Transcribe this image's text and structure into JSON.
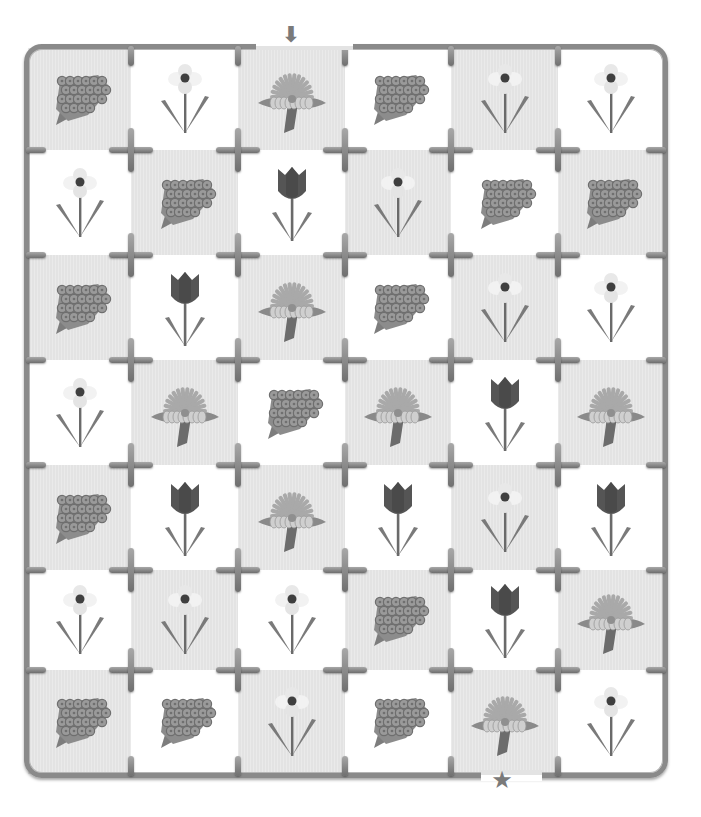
{
  "puzzle": {
    "type": "flower-maze",
    "columns": 6,
    "rows": 7,
    "entrance": {
      "marker": "down-arrow",
      "glyph": "⬇",
      "column": 2,
      "side": "top"
    },
    "exit": {
      "marker": "star",
      "glyph": "★",
      "column": 4,
      "side": "bottom"
    },
    "colors": {
      "frame": "#8a8a8a",
      "gray_cell": "#e3e3e3",
      "white_cell": "#ffffff",
      "marker": "#7a7a7a"
    },
    "grid": [
      [
        "hyacinth",
        "daffodil",
        "daisy",
        "hyacinth",
        "daffodil",
        "daffodil"
      ],
      [
        "daffodil",
        "hyacinth",
        "tulip",
        "daffodil",
        "hyacinth",
        "hyacinth"
      ],
      [
        "hyacinth",
        "tulip",
        "daisy",
        "hyacinth",
        "daffodil",
        "daffodil"
      ],
      [
        "daffodil",
        "daisy",
        "hyacinth",
        "daisy",
        "tulip",
        "daisy"
      ],
      [
        "hyacinth",
        "tulip",
        "daisy",
        "tulip",
        "daffodil",
        "tulip"
      ],
      [
        "daffodil",
        "daffodil",
        "daffodil",
        "hyacinth",
        "tulip",
        "daisy"
      ],
      [
        "hyacinth",
        "hyacinth",
        "daffodil",
        "hyacinth",
        "daisy",
        "daffodil"
      ]
    ]
  }
}
